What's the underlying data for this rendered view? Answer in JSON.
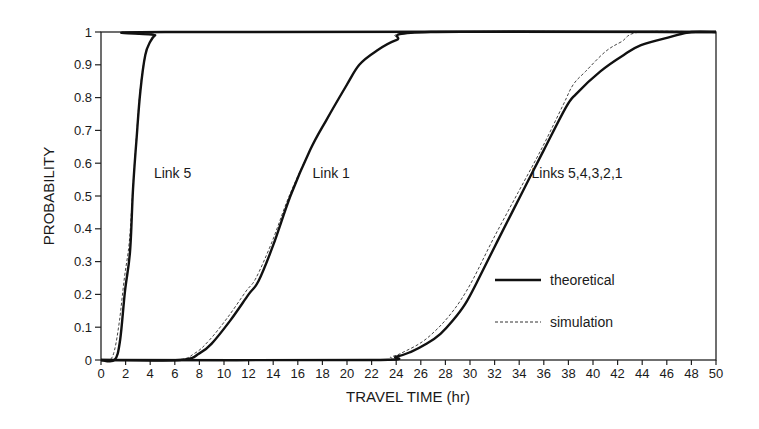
{
  "chart_data": {
    "type": "line",
    "title": "",
    "xlabel": "TRAVEL TIME (hr)",
    "ylabel": "PROBABILITY",
    "xlim": [
      0,
      50
    ],
    "ylim": [
      0,
      1
    ],
    "xticks": [
      0,
      2,
      4,
      6,
      8,
      10,
      12,
      14,
      16,
      18,
      20,
      22,
      24,
      26,
      28,
      30,
      32,
      34,
      36,
      38,
      40,
      42,
      44,
      46,
      48,
      50
    ],
    "yticks": [
      0,
      0.1,
      0.2,
      0.3,
      0.4,
      0.5,
      0.6,
      0.7,
      0.8,
      0.9,
      1
    ],
    "ytick_labels": [
      "0",
      "0.1",
      "0.2",
      "0.3",
      "0.4",
      "0.5",
      "0.6",
      "0.7",
      "0.8",
      "0.9",
      "1"
    ],
    "grid": false,
    "legend_position": "lower right (inside plot)",
    "legend": [
      {
        "name": "theoretical",
        "style": "solid"
      },
      {
        "name": "simulation",
        "style": "dashed"
      }
    ],
    "annotations": [
      {
        "text": "Link 5",
        "x": 4.3,
        "y": 0.57
      },
      {
        "text": "Link 1",
        "x": 17.2,
        "y": 0.57
      },
      {
        "text": "Links 5,4,3,2,1",
        "x": 35.0,
        "y": 0.57
      }
    ],
    "series": [
      {
        "name": "Link 5 theoretical",
        "group": "Link 5",
        "style": "solid",
        "x": [
          0,
          1.1,
          1.55,
          1.95,
          2.36,
          2.6,
          2.9,
          3.2,
          3.6,
          4.0,
          4.4,
          5.2,
          50
        ],
        "y": [
          0,
          0,
          0.06,
          0.21,
          0.33,
          0.52,
          0.68,
          0.82,
          0.93,
          0.97,
          0.99,
          1.0,
          1.0
        ]
      },
      {
        "name": "Link 5 simulation",
        "group": "Link 5",
        "style": "dashed",
        "x": [
          0,
          0.7,
          1.1,
          1.5,
          1.9,
          2.3,
          2.6,
          2.9,
          3.2,
          3.6,
          4.0,
          4.4,
          5.2,
          50
        ],
        "y": [
          0,
          0,
          0.03,
          0.12,
          0.25,
          0.36,
          0.53,
          0.69,
          0.83,
          0.93,
          0.97,
          0.99,
          1.0,
          1.0
        ]
      },
      {
        "name": "Link 1 theoretical",
        "group": "Link 1",
        "style": "solid",
        "x": [
          0,
          6.4,
          8.0,
          9.0,
          10.5,
          12.0,
          12.8,
          14.0,
          15.4,
          17.0,
          18.3,
          20.0,
          21.0,
          22.3,
          24.0,
          26.8,
          50
        ],
        "y": [
          0,
          0,
          0.02,
          0.05,
          0.12,
          0.2,
          0.24,
          0.35,
          0.5,
          0.64,
          0.73,
          0.84,
          0.9,
          0.94,
          0.975,
          1.0,
          1.0
        ]
      },
      {
        "name": "Link 1 simulation",
        "group": "Link 1",
        "style": "dashed",
        "x": [
          0,
          6.0,
          7.6,
          8.8,
          10.3,
          11.8,
          12.6,
          13.9,
          15.3,
          17.0,
          18.3,
          20.0,
          21.0,
          22.3,
          24.0,
          26.5,
          50
        ],
        "y": [
          0,
          0,
          0.02,
          0.06,
          0.13,
          0.21,
          0.25,
          0.36,
          0.5,
          0.64,
          0.73,
          0.84,
          0.9,
          0.94,
          0.975,
          1.0,
          1.0
        ]
      },
      {
        "name": "Links 5,4,3,2,1 theoretical",
        "group": "Links 5,4,3,2,1",
        "style": "solid",
        "x": [
          0,
          21.9,
          24.0,
          25.2,
          26.5,
          27.6,
          28.6,
          29.6,
          30.6,
          32.2,
          34.1,
          36.0,
          37.8,
          38.6,
          40.6,
          42.5,
          43.9,
          46.3,
          48.0,
          50
        ],
        "y": [
          0,
          0,
          0.01,
          0.025,
          0.05,
          0.08,
          0.12,
          0.17,
          0.24,
          0.36,
          0.5,
          0.64,
          0.77,
          0.81,
          0.88,
          0.93,
          0.96,
          0.985,
          1.0,
          1.0
        ]
      },
      {
        "name": "Links 5,4,3,2,1 simulation",
        "group": "Links 5,4,3,2,1",
        "style": "dashed",
        "x": [
          0,
          21.5,
          23.6,
          24.8,
          26.1,
          27.2,
          28.2,
          29.2,
          30.3,
          31.9,
          33.9,
          35.9,
          37.6,
          38.4,
          39.4,
          41.0,
          42.3,
          43.9,
          50
        ],
        "y": [
          0,
          0,
          0.01,
          0.028,
          0.055,
          0.09,
          0.13,
          0.18,
          0.25,
          0.37,
          0.51,
          0.65,
          0.78,
          0.84,
          0.88,
          0.94,
          0.97,
          1.0,
          1.0
        ]
      }
    ]
  }
}
